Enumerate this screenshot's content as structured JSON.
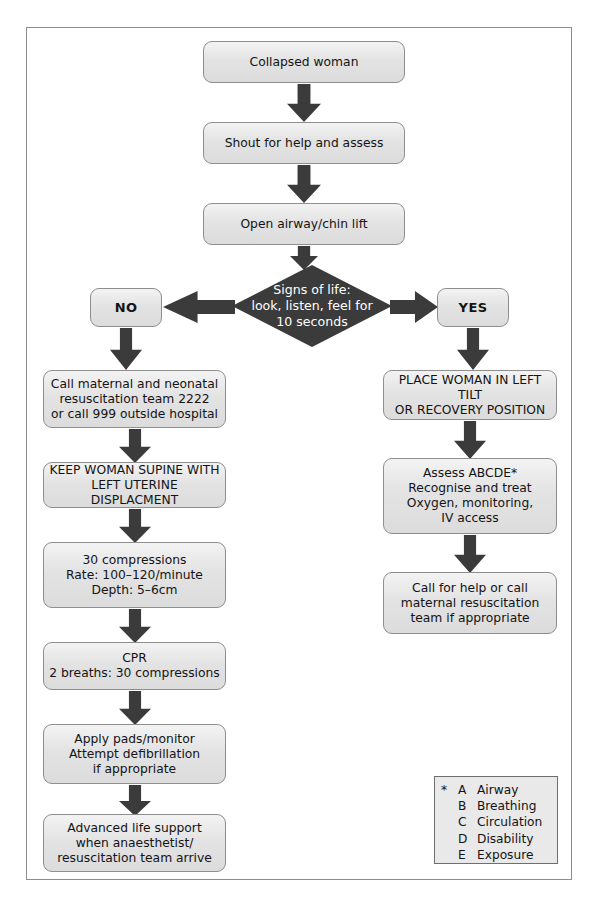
{
  "diagram": {
    "colors": {
      "box_fill": "#e3e3e3",
      "box_border": "#8e8e8e",
      "arrow": "#3b3b3b",
      "diamond_fill": "#3b3b3b",
      "diamond_text": "#ffffff",
      "frame_border": "#8d8d8d",
      "legend_fill": "#e9e9e9"
    },
    "nodes": {
      "collapsed_woman": "Collapsed woman",
      "shout_for_help": "Shout for help and assess",
      "open_airway": "Open airway/chin lift",
      "signs_of_life": "Signs of life:\nlook, listen, feel for\n10 seconds",
      "no_label": "NO",
      "yes_label": "YES",
      "call_team": "Call maternal and neonatal\nresuscitation team 2222\nor call 999 outside hospital",
      "keep_supine": "KEEP WOMAN SUPINE WITH\nLEFT UTERINE DISPLACMENT",
      "compressions": "30 compressions\nRate: 100–120/minute\nDepth: 5–6cm",
      "cpr": "CPR\n2 breaths: 30 compressions",
      "defibrillation": "Apply pads/monitor\nAttempt defibrillation\nif appropriate",
      "advanced_life_support": "Advanced life support\nwhen anaesthetist/\nresuscitation team arrive",
      "place_woman": "PLACE WOMAN IN LEFT TILT\nOR RECOVERY POSITION",
      "assess_abcde": "Assess ABCDE*\nRecognise and treat\nOxygen, monitoring,\nIV access",
      "call_for_help": "Call for help or call\nmaternal resuscitation\nteam if appropriate"
    },
    "legend": {
      "star": "*",
      "rows": [
        {
          "letter": "A",
          "term": "Airway"
        },
        {
          "letter": "B",
          "term": "Breathing"
        },
        {
          "letter": "C",
          "term": "Circulation"
        },
        {
          "letter": "D",
          "term": "Disability"
        },
        {
          "letter": "E",
          "term": "Exposure"
        }
      ]
    }
  }
}
